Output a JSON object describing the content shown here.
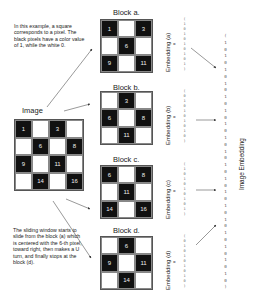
{
  "notes": {
    "top": "In this example, a square corresponds to a pixel. The black pixels have a color value of 1, while the white 0.",
    "bottom": "The sliding window starts to slide from the block (a) which is centered with the 6-th pixel, toward right, then makes a U turn, and finally stops at the block (d)."
  },
  "image": {
    "label": "Image",
    "cells": [
      {
        "n": "1",
        "c": "black"
      },
      {
        "n": "",
        "c": "white"
      },
      {
        "n": "3",
        "c": "black"
      },
      {
        "n": "",
        "c": "white"
      },
      {
        "n": "",
        "c": "white"
      },
      {
        "n": "6",
        "c": "black"
      },
      {
        "n": "",
        "c": "white"
      },
      {
        "n": "8",
        "c": "black"
      },
      {
        "n": "9",
        "c": "black"
      },
      {
        "n": "",
        "c": "white"
      },
      {
        "n": "11",
        "c": "black"
      },
      {
        "n": "",
        "c": "white"
      },
      {
        "n": "",
        "c": "white"
      },
      {
        "n": "14",
        "c": "black"
      },
      {
        "n": "",
        "c": "white"
      },
      {
        "n": "16",
        "c": "black"
      }
    ]
  },
  "blocks": [
    {
      "label": "Block a.",
      "embedding_label": "Embedding (a)",
      "eq": "=",
      "cells": [
        {
          "n": "1",
          "c": "black"
        },
        {
          "n": "",
          "c": "white"
        },
        {
          "n": "3",
          "c": "black"
        },
        {
          "n": "",
          "c": "white"
        },
        {
          "n": "6",
          "c": "black"
        },
        {
          "n": "",
          "c": "white"
        },
        {
          "n": "9",
          "c": "black"
        },
        {
          "n": "",
          "c": "white"
        },
        {
          "n": "11",
          "c": "black"
        }
      ],
      "vector": [
        "(",
        "1",
        "0",
        "1",
        "0",
        "1",
        "0",
        "1",
        "0",
        "1",
        ")"
      ]
    },
    {
      "label": "Block b.",
      "embedding_label": "Embedding (b)",
      "eq": "=",
      "cells": [
        {
          "n": "",
          "c": "white"
        },
        {
          "n": "3",
          "c": "black"
        },
        {
          "n": "",
          "c": "white"
        },
        {
          "n": "6",
          "c": "black"
        },
        {
          "n": "",
          "c": "white"
        },
        {
          "n": "8",
          "c": "black"
        },
        {
          "n": "",
          "c": "white"
        },
        {
          "n": "11",
          "c": "black"
        },
        {
          "n": "",
          "c": "white"
        }
      ],
      "vector": [
        "(",
        "0",
        "1",
        "0",
        "1",
        "0",
        "1",
        "0",
        "1",
        "0",
        ")"
      ]
    },
    {
      "label": "Block c.",
      "embedding_label": "Embedding (c)",
      "eq": "=",
      "cells": [
        {
          "n": "6",
          "c": "black"
        },
        {
          "n": "",
          "c": "white"
        },
        {
          "n": "8",
          "c": "black"
        },
        {
          "n": "",
          "c": "white"
        },
        {
          "n": "11",
          "c": "black"
        },
        {
          "n": "",
          "c": "white"
        },
        {
          "n": "14",
          "c": "black"
        },
        {
          "n": "",
          "c": "white"
        },
        {
          "n": "16",
          "c": "black"
        }
      ],
      "vector": [
        "(",
        "1",
        "0",
        "1",
        "0",
        "1",
        "0",
        "1",
        "0",
        "1",
        ")"
      ]
    },
    {
      "label": "Block d.",
      "embedding_label": "Embedding (d)",
      "eq": "=",
      "cells": [
        {
          "n": "",
          "c": "white"
        },
        {
          "n": "6",
          "c": "black"
        },
        {
          "n": "",
          "c": "white"
        },
        {
          "n": "9",
          "c": "black"
        },
        {
          "n": "",
          "c": "white"
        },
        {
          "n": "11",
          "c": "black"
        },
        {
          "n": "",
          "c": "white"
        },
        {
          "n": "14",
          "c": "black"
        },
        {
          "n": "",
          "c": "white"
        }
      ],
      "vector": [
        "(",
        "0",
        "1",
        "0",
        "1",
        "0",
        "1",
        "0",
        "1",
        "0",
        ")"
      ]
    }
  ],
  "image_embedding": {
    "label": "Image Embedding",
    "vector": [
      "(",
      "1",
      "0",
      "1",
      "0",
      "1",
      "0",
      "1",
      "0",
      "1",
      "0",
      "1",
      "0",
      "1",
      "0",
      "1",
      "0",
      "1",
      "0",
      "1",
      "0",
      "1",
      "0",
      "1",
      "0",
      "1",
      "0",
      "1",
      "0",
      "1",
      "0",
      "1",
      "0",
      "1",
      "0",
      "1",
      "0",
      ")"
    ]
  },
  "colors": {
    "black_pixel": "#111111",
    "white_pixel": "#ffffff",
    "arrow": "#333333"
  }
}
